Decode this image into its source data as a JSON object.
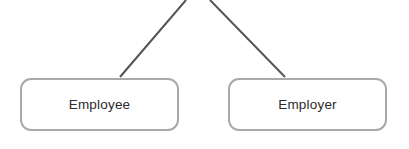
{
  "diagram": {
    "background_color": "#ffffff",
    "nodes": [
      {
        "id": "employee",
        "label": "Employee",
        "shape": "rounded-rectangle",
        "x": 20,
        "y": 78,
        "width": 159,
        "height": 53,
        "border_color": "#a9a9a9",
        "fill_color": "#ffffff",
        "text_color": "#2b2b2b"
      },
      {
        "id": "employer",
        "label": "Employer",
        "shape": "rounded-rectangle",
        "x": 228,
        "y": 78,
        "width": 159,
        "height": 53,
        "border_color": "#a9a9a9",
        "fill_color": "#ffffff",
        "text_color": "#2b2b2b"
      }
    ],
    "connectors": [
      {
        "id": "connector-to-employee",
        "label": "",
        "color": "#555555",
        "width": 2,
        "x1": 186,
        "y1": 0,
        "x2": 120,
        "y2": 77
      },
      {
        "id": "connector-to-employer",
        "label": "",
        "color": "#555555",
        "width": 2,
        "x1": 210,
        "y1": 0,
        "x2": 285,
        "y2": 77
      }
    ]
  }
}
